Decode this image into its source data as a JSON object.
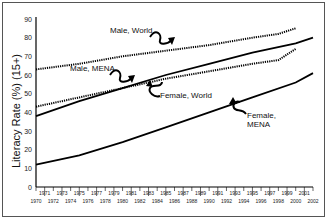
{
  "chart_data": {
    "type": "line",
    "title": "",
    "xlabel": "",
    "ylabel": "Literacy Rate (%) (15+)",
    "ylim": [
      0,
      90
    ],
    "xlim": [
      1970,
      2002
    ],
    "yticks": [
      0,
      10,
      20,
      30,
      40,
      50,
      60,
      70,
      80,
      90
    ],
    "xticks_upper": [
      "1971",
      "1973",
      "1975",
      "1977",
      "1979",
      "1981",
      "1983",
      "1985",
      "1987",
      "1989",
      "1991",
      "1993",
      "1995",
      "1997",
      "1999",
      "2001"
    ],
    "xticks_lower": [
      "1970",
      "1972",
      "1974",
      "1976",
      "1978",
      "1980",
      "1982",
      "1984",
      "1986",
      "1988",
      "1990",
      "1992",
      "1994",
      "1996",
      "1998",
      "2000",
      "2002"
    ],
    "grid": false,
    "legend": "inline annotations",
    "series": [
      {
        "name": "Male, World",
        "style": "dotted",
        "x": [
          1970,
          1975,
          1980,
          1985,
          1990,
          1995,
          1998,
          2000
        ],
        "values": [
          63,
          66,
          70,
          73,
          76,
          80,
          82,
          85
        ]
      },
      {
        "name": "Male, MENA",
        "style": "solid",
        "x": [
          1970,
          1975,
          1980,
          1985,
          1990,
          1995,
          2000,
          2002
        ],
        "values": [
          38,
          46,
          53,
          60,
          66,
          72,
          77,
          80
        ]
      },
      {
        "name": "Female, World",
        "style": "dotted",
        "x": [
          1970,
          1975,
          1980,
          1985,
          1990,
          1995,
          1998,
          2000
        ],
        "values": [
          43,
          48,
          53,
          58,
          62,
          66,
          68,
          74
        ]
      },
      {
        "name": "Female, MENA",
        "style": "solid",
        "x": [
          1970,
          1975,
          1980,
          1985,
          1990,
          1995,
          2000,
          2002
        ],
        "values": [
          12,
          17,
          24,
          32,
          40,
          48,
          56,
          61
        ]
      }
    ],
    "annotations": [
      "Male, World",
      "Male, MENA",
      "Female, World",
      "Female, MENA"
    ]
  },
  "labels": {
    "ylabel": "Literacy Rate (%) (15+)",
    "male_world": "Male, World",
    "male_mena": "Male, MENA",
    "female_world": "Female, World",
    "female_mena_1": "Female,",
    "female_mena_2": "MENA"
  }
}
